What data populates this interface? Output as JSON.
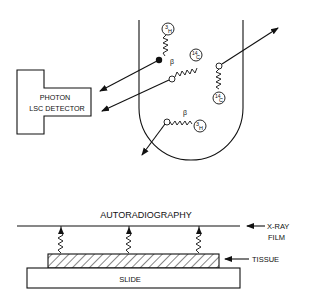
{
  "top_panel": {
    "detector": {
      "line1": "PHOTON",
      "line2": "LSC DETECTOR"
    },
    "isotopes": [
      {
        "label": "3H",
        "sup": "3",
        "sym": "H"
      },
      {
        "label": "14C",
        "sup": "14",
        "sym": "C"
      },
      {
        "label": "14C",
        "sup": "14",
        "sym": "C"
      },
      {
        "label": "3H",
        "sup": "3",
        "sym": "H"
      }
    ],
    "beta_labels": [
      "β",
      "β"
    ]
  },
  "bottom_panel": {
    "title": "AUTORADIOGRAPHY",
    "film_label_line1": "X-RAY",
    "film_label_line2": "FILM",
    "tissue_label": "TISSUE",
    "slide_label": "SLIDE"
  },
  "colors": {
    "ink": "#111111",
    "background": "#ffffff"
  }
}
